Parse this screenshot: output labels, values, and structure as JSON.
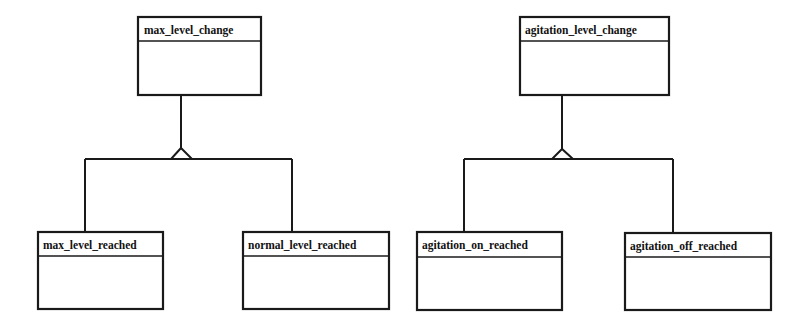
{
  "diagram": {
    "type": "uml-class-generalization",
    "colors": {
      "stroke": "#1a1a1a",
      "background": "#ffffff",
      "text": "#111111"
    },
    "hierarchies": [
      {
        "parent": {
          "name": "max_level_change"
        },
        "children": [
          {
            "name": "max_level_reached"
          },
          {
            "name": "normal_level_reached"
          }
        ]
      },
      {
        "parent": {
          "name": "agitation_level_change"
        },
        "children": [
          {
            "name": "agitation_on_reached"
          },
          {
            "name": "agitation_off_reached"
          }
        ]
      }
    ]
  }
}
